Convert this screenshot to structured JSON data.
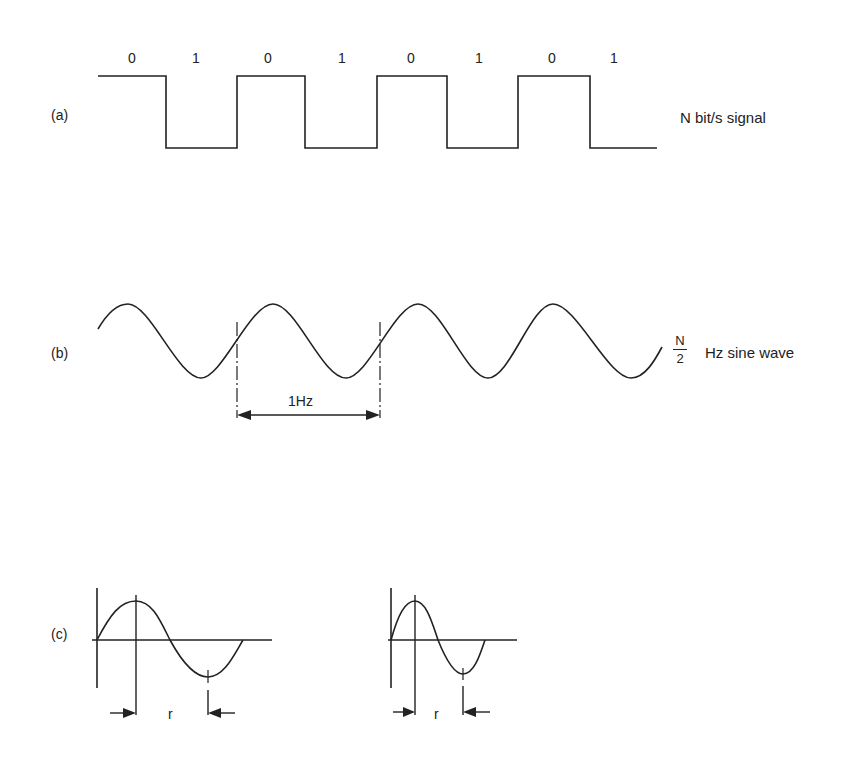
{
  "panel_a": {
    "label": "(a)",
    "caption": "N bit/s signal",
    "bits": [
      "0",
      "1",
      "0",
      "1",
      "0",
      "1",
      "0",
      "1"
    ]
  },
  "panel_b": {
    "label": "(b)",
    "caption_fraction_num": "N",
    "caption_fraction_den": "2",
    "caption": "Hz sine wave",
    "period_label": "1Hz"
  },
  "panel_c": {
    "label": "(c)",
    "interval_label_1": "r",
    "interval_label_2": "r"
  },
  "colors": {
    "ink": "#222222",
    "background": "#ffffff"
  }
}
